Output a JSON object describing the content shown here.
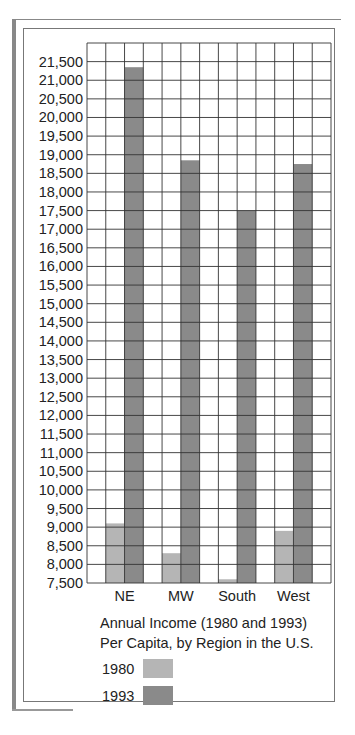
{
  "chart_data": {
    "type": "bar",
    "title": "Annual Income (1980 and 1993) Per Capita, by Region in the U.S.",
    "title_lines": [
      "Annual Income (1980 and 1993)",
      "Per Capita, by Region in the U.S."
    ],
    "xlabel": "",
    "ylabel": "",
    "categories": [
      "NE",
      "MW",
      "South",
      "West"
    ],
    "series": [
      {
        "name": "1980",
        "color": "#b5b5b5",
        "values": [
          9100,
          8300,
          7600,
          8900
        ]
      },
      {
        "name": "1993",
        "color": "#8a8a8a",
        "values": [
          21350,
          18850,
          17500,
          18750
        ]
      }
    ],
    "ylim": [
      7500,
      22000
    ],
    "yticks": [
      7500,
      8000,
      8500,
      9000,
      9500,
      10000,
      10500,
      11000,
      11500,
      12000,
      12500,
      13000,
      13500,
      14000,
      14500,
      15000,
      15500,
      16000,
      16500,
      17000,
      17500,
      18000,
      18500,
      19000,
      19500,
      20000,
      20500,
      21000,
      21500
    ],
    "ytick_labels": [
      "7,500",
      "8,000",
      "8,500",
      "9,000",
      "9,500",
      "10,000",
      "10,500",
      "11,000",
      "11,500",
      "12,000",
      "12,500",
      "13,000",
      "13,500",
      "14,000",
      "14,500",
      "15,000",
      "15,500",
      "16,000",
      "16,500",
      "17,000",
      "17,500",
      "18,000",
      "18,500",
      "19,000",
      "19,500",
      "20,000",
      "20,500",
      "21,000",
      "21,500"
    ],
    "grid": true,
    "legend_position": "bottom-left",
    "legend": [
      {
        "label": "1980",
        "color": "#b5b5b5"
      },
      {
        "label": "1993",
        "color": "#8a8a8a"
      }
    ]
  }
}
